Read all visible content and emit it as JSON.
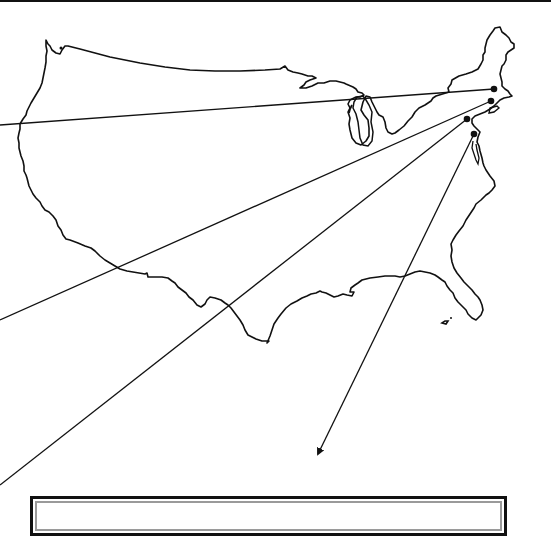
{
  "figure": {
    "title": "",
    "colors": {
      "outline": "#111111",
      "background": "#ffffff",
      "box_inner_border": "#9a9a9a"
    }
  },
  "map": {
    "region": "Continental United States",
    "markers": [
      {
        "id": "marker-1",
        "region": "New England (Massachusetts)",
        "x": 494,
        "y": 89
      },
      {
        "id": "marker-2",
        "region": "Southern New England / New York",
        "x": 491,
        "y": 101
      },
      {
        "id": "marker-3",
        "region": "Pennsylvania",
        "x": 467,
        "y": 119
      },
      {
        "id": "marker-4",
        "region": "Maryland / Delaware",
        "x": 474,
        "y": 134
      },
      {
        "id": "marker-small",
        "region": "Puget Sound (Washington)",
        "x": 61,
        "y": 48
      }
    ],
    "leader_lines": [
      {
        "from": "marker-1",
        "to_x": 0,
        "to_y": 125,
        "arrow": false
      },
      {
        "from": "marker-2",
        "to_x": 0,
        "to_y": 320,
        "arrow": false
      },
      {
        "from": "marker-3",
        "to_x": 0,
        "to_y": 485,
        "arrow": false
      },
      {
        "from": "marker-4",
        "to_x": 316,
        "to_y": 458,
        "arrow": true
      }
    ]
  },
  "caption_box": {
    "text": ""
  }
}
